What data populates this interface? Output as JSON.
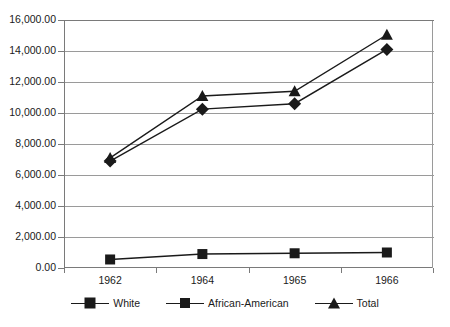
{
  "chart_data": {
    "type": "line",
    "title": "",
    "subtitle": "",
    "xlabel": "",
    "ylabel": "",
    "categories": [
      "1962",
      "1964",
      "1965",
      "1966"
    ],
    "series": [
      {
        "name": "White",
        "marker": "diamond",
        "color": "#1a1a1a",
        "values": [
          6900,
          10250,
          10600,
          14100
        ]
      },
      {
        "name": "African-American",
        "marker": "square",
        "color": "#1a1a1a",
        "values": [
          550,
          900,
          950,
          1000
        ]
      },
      {
        "name": "Total",
        "marker": "triangle",
        "color": "#1a1a1a",
        "values": [
          7100,
          11100,
          11400,
          15050
        ]
      }
    ],
    "ylim": [
      0,
      16000
    ],
    "ytick_step": 2000,
    "ytick_labels": [
      "16,000.00",
      "14,000.00",
      "12,000.00",
      "10,000.00",
      "8,000.00",
      "6,000.00",
      "4,000.00",
      "2,000.00",
      "0.00"
    ],
    "ytick_values": [
      16000,
      14000,
      12000,
      10000,
      8000,
      6000,
      4000,
      2000,
      0
    ],
    "grid": true,
    "grid_axis": "y",
    "legend_position": "bottom",
    "axis_color": "#7a7a7a",
    "grid_color": "#9a9a9a",
    "background": "#ffffff"
  },
  "legend": {
    "items": [
      {
        "label": "White"
      },
      {
        "label": "African-American"
      },
      {
        "label": "Total"
      }
    ]
  }
}
